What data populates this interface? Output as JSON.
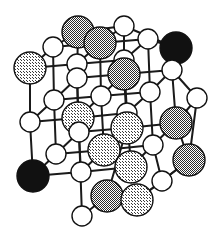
{
  "figure": {
    "background_color": "#ffffff",
    "bond_color": "#1a1a1a",
    "bond_width": 2.0,
    "outline_color": "#111111",
    "outline_width": 1.4,
    "canvas": {
      "width": 217,
      "height": 230
    }
  },
  "legend": {
    "species": [
      {
        "name": "black-atom",
        "fill": "#111111",
        "pattern": "solid",
        "radius": 15.5,
        "label": ""
      },
      {
        "name": "dark-gray-atom",
        "fill": "#6f6f6f",
        "pattern": "checker",
        "radius": 15.5,
        "label": ""
      },
      {
        "name": "light-gray-atom",
        "fill": "#c2c2c2",
        "pattern": "checker",
        "radius": 15.5,
        "label": ""
      },
      {
        "name": "white-atom",
        "fill": "#ffffff",
        "pattern": "solid",
        "radius": 9.5,
        "label": ""
      }
    ]
  },
  "lattice": {
    "projection": "oblique",
    "grid_size": [
      3,
      3,
      3
    ],
    "origin": [
      33,
      176
    ],
    "vector_a": [
      48,
      -7
    ],
    "vector_b": [
      0,
      -54
    ],
    "vector_c": [
      23,
      -22
    ],
    "nodes": [
      {
        "id": "n000",
        "grid": [
          0,
          0,
          0
        ],
        "x": 33,
        "y": 176,
        "type": "black-atom",
        "r": 16
      },
      {
        "id": "n100",
        "grid": [
          1,
          0,
          0
        ],
        "x": 81,
        "y": 172,
        "type": "white-atom",
        "r": 10
      },
      {
        "id": "n200",
        "grid": [
          2,
          0,
          0
        ],
        "x": 131,
        "y": 167,
        "type": "light-gray-atom",
        "r": 16
      },
      {
        "id": "n010",
        "grid": [
          0,
          1,
          0
        ],
        "x": 30,
        "y": 122,
        "type": "white-atom",
        "r": 10
      },
      {
        "id": "n110",
        "grid": [
          1,
          1,
          0
        ],
        "x": 78,
        "y": 118,
        "type": "light-gray-atom",
        "r": 16
      },
      {
        "id": "n210",
        "grid": [
          2,
          1,
          0
        ],
        "x": 127,
        "y": 113,
        "type": "white-atom",
        "r": 10
      },
      {
        "id": "n020",
        "grid": [
          0,
          2,
          0
        ],
        "x": 30,
        "y": 68,
        "type": "light-gray-atom",
        "r": 16
      },
      {
        "id": "n120",
        "grid": [
          1,
          2,
          0
        ],
        "x": 77,
        "y": 64,
        "type": "white-atom",
        "r": 10
      },
      {
        "id": "n220",
        "grid": [
          2,
          2,
          0
        ],
        "x": 124,
        "y": 60,
        "type": "white-atom",
        "r": 10
      },
      {
        "id": "n001",
        "grid": [
          0,
          0,
          1
        ],
        "x": 56,
        "y": 154,
        "type": "white-atom",
        "r": 10
      },
      {
        "id": "n101",
        "grid": [
          1,
          0,
          1
        ],
        "x": 104,
        "y": 150,
        "type": "light-gray-atom",
        "r": 16
      },
      {
        "id": "n201",
        "grid": [
          2,
          0,
          1
        ],
        "x": 153,
        "y": 145,
        "type": "white-atom",
        "r": 10
      },
      {
        "id": "n011",
        "grid": [
          0,
          1,
          1
        ],
        "x": 54,
        "y": 100,
        "type": "white-atom",
        "r": 10
      },
      {
        "id": "n111",
        "grid": [
          1,
          1,
          1
        ],
        "x": 101,
        "y": 96,
        "type": "white-atom",
        "r": 10
      },
      {
        "id": "n211",
        "grid": [
          2,
          1,
          1
        ],
        "x": 150,
        "y": 92,
        "type": "white-atom",
        "r": 10
      },
      {
        "id": "n021",
        "grid": [
          0,
          2,
          1
        ],
        "x": 53,
        "y": 47,
        "type": "white-atom",
        "r": 10
      },
      {
        "id": "n121",
        "grid": [
          1,
          2,
          1
        ],
        "x": 100,
        "y": 43,
        "type": "dark-gray-atom",
        "r": 16
      },
      {
        "id": "n221",
        "grid": [
          2,
          2,
          1
        ],
        "x": 148,
        "y": 39,
        "type": "white-atom",
        "r": 10
      },
      {
        "id": "n002",
        "grid": [
          0,
          0,
          2
        ],
        "x": 79,
        "y": 132,
        "type": "white-atom",
        "r": 10
      },
      {
        "id": "n102",
        "grid": [
          1,
          0,
          2
        ],
        "x": 127,
        "y": 128,
        "type": "light-gray-atom",
        "r": 16
      },
      {
        "id": "n202",
        "grid": [
          2,
          0,
          2
        ],
        "x": 176,
        "y": 123,
        "type": "dark-gray-atom",
        "r": 16
      },
      {
        "id": "n012",
        "grid": [
          0,
          1,
          2
        ],
        "x": 77,
        "y": 78,
        "type": "white-atom",
        "r": 10
      },
      {
        "id": "n112",
        "grid": [
          1,
          1,
          2
        ],
        "x": 124,
        "y": 74,
        "type": "dark-gray-atom",
        "r": 16
      },
      {
        "id": "n212",
        "grid": [
          2,
          1,
          2
        ],
        "x": 172,
        "y": 70,
        "type": "white-atom",
        "r": 10
      },
      {
        "id": "n022",
        "grid": [
          0,
          2,
          2
        ],
        "x": 78,
        "y": 32,
        "type": "dark-gray-atom",
        "r": 16
      },
      {
        "id": "n122",
        "grid": [
          1,
          2,
          2
        ],
        "x": 124,
        "y": 26,
        "type": "white-atom",
        "r": 10
      },
      {
        "id": "n222",
        "grid": [
          2,
          2,
          2
        ],
        "x": 176,
        "y": 48,
        "type": "black-atom",
        "r": 16
      },
      {
        "id": "e000",
        "grid": [
          0,
          0,
          3
        ],
        "x": 107,
        "y": 196,
        "type": "dark-gray-atom",
        "r": 16
      },
      {
        "id": "e001",
        "grid": [
          1,
          0,
          3
        ],
        "x": 82,
        "y": 216,
        "type": "white-atom",
        "r": 10
      },
      {
        "id": "e002",
        "grid": [
          2,
          0,
          3
        ],
        "x": 137,
        "y": 200,
        "type": "light-gray-atom",
        "r": 16
      },
      {
        "id": "e003",
        "grid": [
          3,
          0,
          2
        ],
        "x": 189,
        "y": 160,
        "type": "dark-gray-atom",
        "r": 16
      },
      {
        "id": "e004",
        "grid": [
          3,
          1,
          1
        ],
        "x": 162,
        "y": 181,
        "type": "white-atom",
        "r": 10
      },
      {
        "id": "e005",
        "grid": [
          3,
          2,
          2
        ],
        "x": 197,
        "y": 98,
        "type": "white-atom",
        "r": 10
      }
    ],
    "edges": [
      [
        "n000",
        "n100"
      ],
      [
        "n100",
        "n200"
      ],
      [
        "n010",
        "n110"
      ],
      [
        "n110",
        "n210"
      ],
      [
        "n020",
        "n120"
      ],
      [
        "n120",
        "n220"
      ],
      [
        "n001",
        "n101"
      ],
      [
        "n101",
        "n201"
      ],
      [
        "n011",
        "n111"
      ],
      [
        "n111",
        "n211"
      ],
      [
        "n021",
        "n121"
      ],
      [
        "n121",
        "n221"
      ],
      [
        "n002",
        "n102"
      ],
      [
        "n102",
        "n202"
      ],
      [
        "n012",
        "n112"
      ],
      [
        "n112",
        "n212"
      ],
      [
        "n022",
        "n122"
      ],
      [
        "n122",
        "n222"
      ],
      [
        "n000",
        "n010"
      ],
      [
        "n010",
        "n020"
      ],
      [
        "n100",
        "n110"
      ],
      [
        "n110",
        "n120"
      ],
      [
        "n200",
        "n210"
      ],
      [
        "n210",
        "n220"
      ],
      [
        "n001",
        "n011"
      ],
      [
        "n011",
        "n021"
      ],
      [
        "n101",
        "n111"
      ],
      [
        "n111",
        "n121"
      ],
      [
        "n201",
        "n211"
      ],
      [
        "n211",
        "n221"
      ],
      [
        "n002",
        "n012"
      ],
      [
        "n012",
        "n022"
      ],
      [
        "n102",
        "n112"
      ],
      [
        "n112",
        "n122"
      ],
      [
        "n202",
        "n212"
      ],
      [
        "n212",
        "n222"
      ],
      [
        "n000",
        "n001"
      ],
      [
        "n001",
        "n002"
      ],
      [
        "n100",
        "n101"
      ],
      [
        "n101",
        "n102"
      ],
      [
        "n200",
        "n201"
      ],
      [
        "n201",
        "n202"
      ],
      [
        "n010",
        "n011"
      ],
      [
        "n011",
        "n012"
      ],
      [
        "n110",
        "n111"
      ],
      [
        "n111",
        "n112"
      ],
      [
        "n210",
        "n211"
      ],
      [
        "n211",
        "n212"
      ],
      [
        "n020",
        "n021"
      ],
      [
        "n021",
        "n022"
      ],
      [
        "n120",
        "n121"
      ],
      [
        "n121",
        "n122"
      ],
      [
        "n220",
        "n221"
      ],
      [
        "n221",
        "n222"
      ],
      [
        "n002",
        "e001"
      ],
      [
        "e001",
        "e000"
      ],
      [
        "e000",
        "e002"
      ],
      [
        "n102",
        "e000"
      ],
      [
        "n202",
        "e003"
      ],
      [
        "e002",
        "e003"
      ],
      [
        "e002",
        "e004"
      ],
      [
        "e004",
        "e003"
      ],
      [
        "n201",
        "e004"
      ],
      [
        "n212",
        "e005"
      ],
      [
        "e005",
        "e003"
      ],
      [
        "n202",
        "e005"
      ]
    ]
  }
}
